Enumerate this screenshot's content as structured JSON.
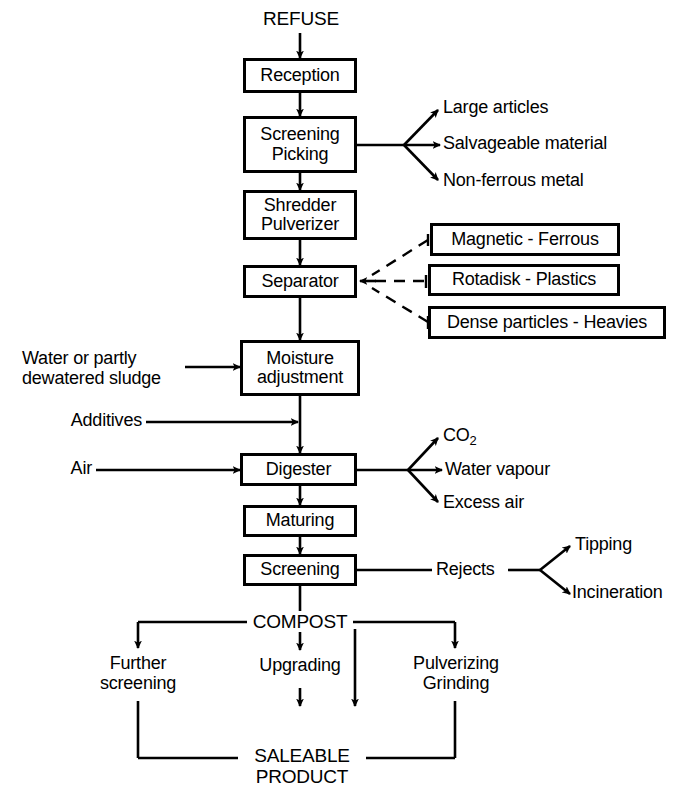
{
  "diagram": {
    "colors": {
      "ink": "#000000",
      "paper": "#ffffff"
    },
    "input_label": "REFUSE",
    "process_boxes": [
      {
        "id": "reception",
        "lines": [
          "Reception"
        ]
      },
      {
        "id": "screening_picking",
        "lines": [
          "Screening",
          "Picking"
        ]
      },
      {
        "id": "shredder_pulverizer",
        "lines": [
          "Shredder",
          "Pulverizer"
        ]
      },
      {
        "id": "separator",
        "lines": [
          "Separator"
        ]
      },
      {
        "id": "moisture_adjustment",
        "lines": [
          "Moisture",
          "adjustment"
        ]
      },
      {
        "id": "digester",
        "lines": [
          "Digester"
        ]
      },
      {
        "id": "maturing",
        "lines": [
          "Maturing"
        ]
      },
      {
        "id": "screening",
        "lines": [
          "Screening"
        ]
      }
    ],
    "screening_picking_outputs": [
      "Large articles",
      "Salvageable material",
      "Non-ferrous metal"
    ],
    "separator_inputs": [
      "Magnetic - Ferrous",
      "Rotadisk - Plastics",
      "Dense particles - Heavies"
    ],
    "left_inputs": [
      {
        "id": "water_sludge",
        "lines": [
          "Water or partly",
          "dewatered sludge"
        ]
      },
      {
        "id": "additives",
        "lines": [
          "Additives"
        ]
      },
      {
        "id": "air",
        "lines": [
          "Air"
        ]
      }
    ],
    "digester_outputs": [
      {
        "text": "CO",
        "subscript": "2"
      },
      {
        "text": "Water vapour",
        "subscript": ""
      },
      {
        "text": "Excess air",
        "subscript": ""
      }
    ],
    "rejects_label": "Rejects",
    "rejects_outputs": [
      "Tipping",
      "Incineration"
    ],
    "compost_label": "COMPOST",
    "compost_branches": [
      {
        "id": "further_screening",
        "lines": [
          "Further",
          "screening"
        ]
      },
      {
        "id": "upgrading",
        "lines": [
          "Upgrading"
        ]
      },
      {
        "id": "direct",
        "lines": []
      },
      {
        "id": "pulverizing_grinding",
        "lines": [
          "Pulverizing",
          "Grinding"
        ]
      }
    ],
    "output_label": {
      "lines": [
        "SALEABLE",
        "PRODUCT"
      ]
    }
  }
}
